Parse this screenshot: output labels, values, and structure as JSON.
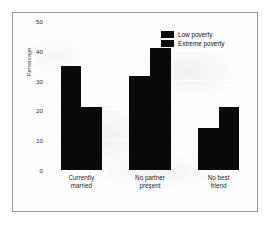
{
  "chart_data": {
    "type": "bar",
    "title": "",
    "xlabel": "",
    "ylabel": "Percentage",
    "ylim": [
      0,
      50
    ],
    "yticks": [
      0,
      10,
      20,
      30,
      40,
      50
    ],
    "grid": true,
    "legend_position": "top-right",
    "categories": [
      "Currently married",
      "No partner present",
      "No best friend"
    ],
    "category_lines": [
      [
        "Currently",
        "married"
      ],
      [
        "No partner",
        "present"
      ],
      [
        "No best",
        "friend"
      ]
    ],
    "series": [
      {
        "name": "Low poverty",
        "color": "#0a0a0a",
        "values": [
          35,
          31.5,
          14
        ]
      },
      {
        "name": "Extreme poverty",
        "color": "#0a0a0a",
        "values": [
          21,
          41,
          21
        ]
      }
    ]
  }
}
